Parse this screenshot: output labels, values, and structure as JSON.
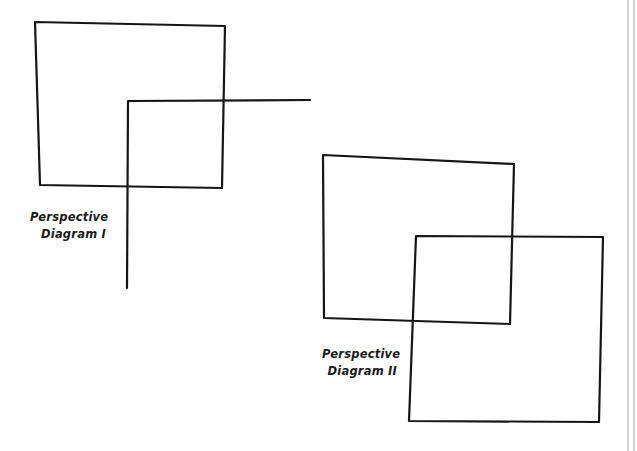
{
  "diagrams": [
    {
      "id": "perspective-diagram-1",
      "caption": {
        "line1": "Perspective",
        "line2": "Diagram I"
      },
      "shapes": {
        "square": {
          "points": [
            [
              35,
              22
            ],
            [
              225,
              26
            ],
            [
              222,
              188
            ],
            [
              40,
              185
            ]
          ]
        },
        "corner_lines": {
          "points": [
            [
              310,
              100
            ],
            [
              128,
              101
            ],
            [
              127,
              288
            ]
          ]
        }
      }
    },
    {
      "id": "perspective-diagram-2",
      "caption": {
        "line1": "Perspective",
        "line2": "Diagram II"
      },
      "shapes": {
        "back_square": {
          "points": [
            [
              323,
              155
            ],
            [
              514,
              164
            ],
            [
              510,
              324
            ],
            [
              324,
              318
            ]
          ]
        },
        "front_square": {
          "points": [
            [
              416,
              236
            ],
            [
              603,
              237
            ],
            [
              599,
              422
            ],
            [
              409,
              421
            ]
          ]
        }
      }
    }
  ],
  "style": {
    "stroke_color": "#151515",
    "background_color": "#ffffff",
    "page_edge_color": "#b8b8b8"
  }
}
